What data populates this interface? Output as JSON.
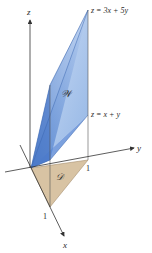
{
  "figure": {
    "axes": {
      "x_label": "x",
      "y_label": "y",
      "z_label": "z",
      "x_tick": "1",
      "y_tick": "1"
    },
    "region_label": "𝒲",
    "domain_label": "𝒟",
    "upper_surface": "z = 3x + 5y",
    "lower_surface": "z = x + y",
    "colors": {
      "region_fill": "#7fa8e0",
      "region_dark": "#4a7ccc",
      "domain_fill": "#d8c3a3",
      "axis": "#333333"
    }
  }
}
